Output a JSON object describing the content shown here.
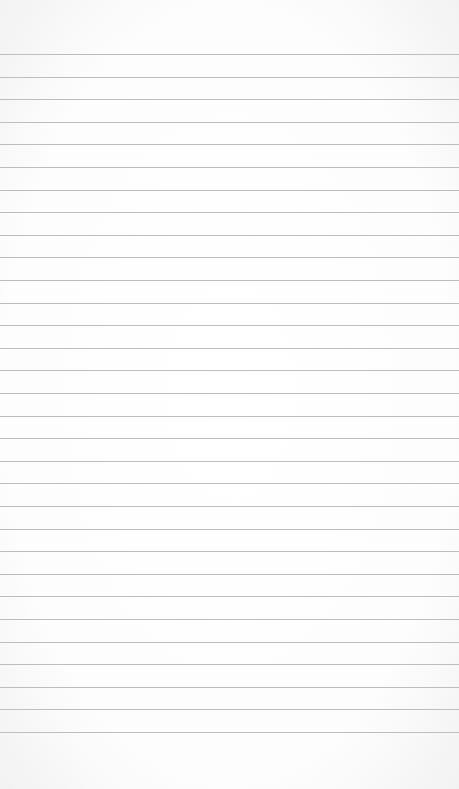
{
  "page": {
    "type": "lined-paper",
    "background_color": "#fdfdfd",
    "line_color": "#bdbdbd",
    "line_count": 31,
    "first_line_y": 54,
    "line_spacing": 22.6,
    "text": ""
  }
}
